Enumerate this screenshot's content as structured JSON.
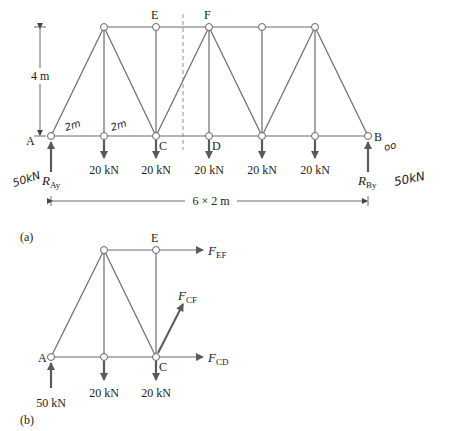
{
  "figure_a": {
    "caption": "(a)",
    "node_labels": {
      "A": "A",
      "B": "B",
      "C": "C",
      "D": "D",
      "E": "E",
      "F": "F"
    },
    "height_dim": "4 m",
    "span_dim": "6 × 2 m",
    "loads": [
      "20 kN",
      "20 kN",
      "20 kN",
      "20 kN",
      "20 kN"
    ],
    "reaction_a": {
      "main": "R",
      "sub": "Ay"
    },
    "reaction_b": {
      "main": "R",
      "sub": "By"
    },
    "handwritten": {
      "panel1": "2m",
      "panel2": "2m",
      "ray_value": "50kN",
      "rby_value": "50kN",
      "b_mark": "oo"
    }
  },
  "figure_b": {
    "caption": "(b)",
    "node_labels": {
      "A": "A",
      "C": "C",
      "E": "E"
    },
    "loads": [
      "20 kN",
      "20 kN"
    ],
    "reaction_a": "50 kN",
    "forces": {
      "ef": {
        "main": "F",
        "sub": "EF"
      },
      "cf": {
        "main": "F",
        "sub": "CF"
      },
      "cd": {
        "main": "F",
        "sub": "CD"
      }
    }
  },
  "colors": {
    "member": "#6b6b6b",
    "arrow": "#666666",
    "text": "#222222"
  }
}
